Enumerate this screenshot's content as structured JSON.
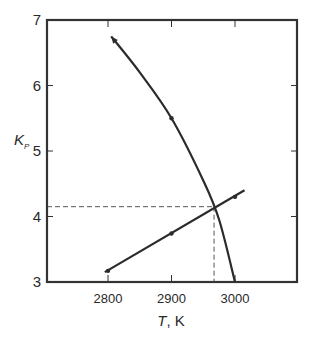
{
  "chart_data": {
    "type": "line",
    "title": "",
    "xlabel": "T, K",
    "xlabel_italic_part": "T",
    "xlabel_unit": "K",
    "ylabel": "Kp",
    "ylabel_main": "K",
    "ylabel_sub": "P",
    "xlim": [
      2700,
      3100
    ],
    "ylim": [
      3,
      7
    ],
    "x_ticks": [
      2800,
      2900,
      3000
    ],
    "x_tick_labels": [
      "2800",
      "2900",
      "3000"
    ],
    "y_ticks": [
      3,
      4,
      5,
      6,
      7
    ],
    "y_tick_labels": [
      "3",
      "4",
      "5",
      "6",
      "7"
    ],
    "grid": false,
    "legend": null,
    "series": [
      {
        "name": "Kp equilibrium curve (decreasing)",
        "x": [
          2805,
          2850,
          2900,
          2950,
          2975,
          3000
        ],
        "y": [
          6.75,
          6.2,
          5.5,
          4.55,
          3.95,
          3.0
        ],
        "markers_at": [
          {
            "x": 2900,
            "y": 5.5
          }
        ],
        "arrow_end": "start"
      },
      {
        "name": "Kp energy-balance line (increasing)",
        "x": [
          2795,
          2900,
          3000,
          3015
        ],
        "y": [
          3.15,
          3.74,
          4.3,
          4.4
        ],
        "markers_at": [
          {
            "x": 2800,
            "y": 3.17
          },
          {
            "x": 2900,
            "y": 3.74
          },
          {
            "x": 3000,
            "y": 4.3
          }
        ]
      }
    ],
    "annotations": [
      {
        "type": "intersection",
        "x": 2967,
        "y": 4.15,
        "dashed_guides": true
      }
    ]
  }
}
